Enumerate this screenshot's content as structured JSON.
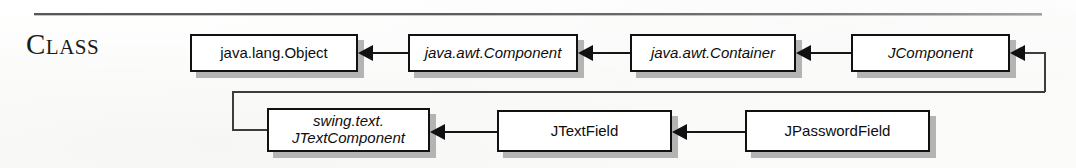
{
  "section": {
    "label_first": "C",
    "label_rest": "LASS"
  },
  "diagram": {
    "type": "class-hierarchy",
    "title": "Class",
    "relationship": "inheritance (arrow points from subclass to superclass)",
    "nodes": [
      {
        "id": "object",
        "label": "java.lang.Object",
        "style": "plain",
        "row": 1,
        "x": 190,
        "y": 34,
        "w": 168,
        "h": 38
      },
      {
        "id": "component",
        "label": "java.awt.Component",
        "style": "italic",
        "row": 1,
        "x": 408,
        "y": 34,
        "w": 170,
        "h": 38
      },
      {
        "id": "container",
        "label": "java.awt.Container",
        "style": "italic",
        "row": 1,
        "x": 630,
        "y": 34,
        "w": 166,
        "h": 38
      },
      {
        "id": "jcomponent",
        "label": "JComponent",
        "style": "italic",
        "row": 1,
        "x": 851,
        "y": 34,
        "w": 159,
        "h": 38
      },
      {
        "id": "jtextcomponent",
        "label": "swing.text.\nJTextComponent",
        "style": "italic",
        "row": 2,
        "x": 267,
        "y": 108,
        "w": 163,
        "h": 44
      },
      {
        "id": "jtextfield",
        "label": "JTextField",
        "style": "plain",
        "row": 2,
        "x": 497,
        "y": 110,
        "w": 175,
        "h": 42
      },
      {
        "id": "jpasswordfield",
        "label": "JPasswordField",
        "style": "plain",
        "row": 2,
        "x": 745,
        "y": 110,
        "w": 185,
        "h": 42
      }
    ],
    "edges": [
      {
        "from": "component",
        "to": "object"
      },
      {
        "from": "container",
        "to": "component"
      },
      {
        "from": "jcomponent",
        "to": "container"
      },
      {
        "from": "jtextcomponent",
        "to": "jcomponent"
      },
      {
        "from": "jtextfield",
        "to": "jtextcomponent"
      },
      {
        "from": "jpasswordfield",
        "to": "jtextfield"
      }
    ]
  },
  "colors": {
    "box_border": "#111111",
    "box_fill": "#ffffff",
    "shadow": "#b4b4b4",
    "line": "#161616",
    "text": "#0d0d0d",
    "page": "#fdfdfc"
  }
}
